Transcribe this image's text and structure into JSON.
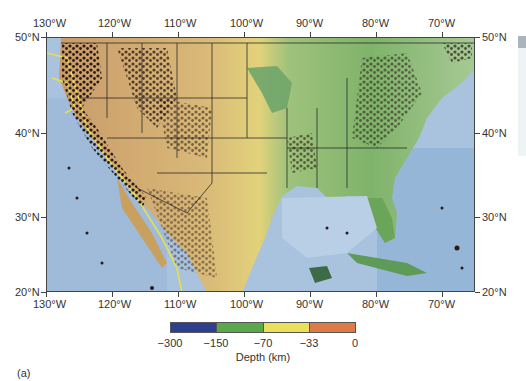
{
  "figure": {
    "panel_label": "(a)",
    "map_description": "Shaded relief map of contiguous United States with earthquake epicenters colored by depth",
    "axes": {
      "top_longitude_labels": [
        "130°W",
        "120°W",
        "110°W",
        "100°W",
        "90°W",
        "80°W",
        "70°W"
      ],
      "bottom_longitude_labels": [
        "130°W",
        "120°W",
        "110°W",
        "100°W",
        "90°W",
        "80°W",
        "70°W"
      ],
      "left_latitude_labels": [
        "50°N",
        "40°N",
        "30°N",
        "20°N"
      ],
      "right_latitude_labels": [
        "50°N",
        "40°N",
        "30°N",
        "20°N"
      ]
    },
    "extent": {
      "lon_min": -130,
      "lon_max": -65,
      "lat_min": 20,
      "lat_max": 50
    },
    "colorbar": {
      "title": "Depth (km)",
      "tick_labels": [
        "−300",
        "−150",
        "−70",
        "−33",
        "0"
      ],
      "segments": [
        {
          "from": -300,
          "to": -150,
          "color": "#2e3f8f"
        },
        {
          "from": -150,
          "to": -70,
          "color": "#5aa84a"
        },
        {
          "from": -70,
          "to": -33,
          "color": "#ebe05a"
        },
        {
          "from": -33,
          "to": 0,
          "color": "#de7a45"
        }
      ]
    },
    "colors": {
      "ocean": "#a9c3de",
      "ocean_deep": "#7f9fc6",
      "lowland_green": "#6aa55a",
      "upland_yellow": "#e2d27a",
      "highland_tan": "#c99b6a",
      "plate_boundary": "#e8e04a",
      "epicenter": "#2a1a14",
      "border_lines": "#2b2b2b"
    }
  }
}
